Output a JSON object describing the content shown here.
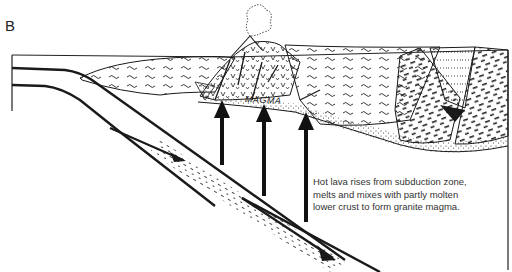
{
  "figure": {
    "panel_label": "B",
    "region_label": "MAGMA",
    "caption_lines": [
      "Hot lava rises from subduction zone,",
      "melts and mixes with partly molten",
      "lower crust to form granite magma."
    ]
  },
  "diagram": {
    "type": "geologic cross-section",
    "elements": [
      {
        "name": "subducting-oceanic-plate",
        "description": "descending slab going down-right, with movement arrows"
      },
      {
        "name": "continental-crust",
        "description": "patterned crust with sedimentary, metamorphic and granitic units"
      },
      {
        "name": "volcano",
        "description": "small cone with eruption cloud at top"
      },
      {
        "name": "magma-zone",
        "description": "stippled zone at base of crust labeled MAGMA"
      },
      {
        "name": "rising-magma-arrows",
        "count": 3,
        "description": "vertical arrows from slab up into magma zone"
      }
    ],
    "colors": {
      "ink": "#1a1a1a",
      "background": "#ffffff",
      "text": "#333333"
    }
  }
}
